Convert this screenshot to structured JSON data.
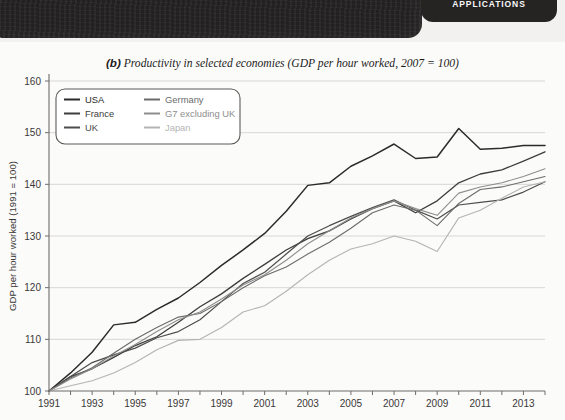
{
  "banner": {
    "tab_line_top": "AND APPLICATIONS",
    "tab_label": "APPLICATIONS"
  },
  "chart_title_prefix": "(b)",
  "chart_title_text": " Productivity in selected economies (GDP per hour worked, 2007 = 100)",
  "colors": {
    "usa": "#2b2b2b",
    "france": "#3d3d3d",
    "uk": "#4d4d4d",
    "germany": "#6b6b6b",
    "g7": "#8e8e8e",
    "japan": "#b4b4b4",
    "grid": "#d9d7d4",
    "axis": "#6e6c69",
    "card_bg": "#fbfbfa",
    "page_bg": "#f2f1ef",
    "banner_bg": "#222020"
  },
  "legend": {
    "items": [
      {
        "label": "USA",
        "color_key": "usa",
        "column": 0
      },
      {
        "label": "France",
        "color_key": "france",
        "column": 0
      },
      {
        "label": "UK",
        "color_key": "uk",
        "column": 0
      },
      {
        "label": "Germany",
        "color_key": "germany",
        "column": 1
      },
      {
        "label": "G7 excluding UK",
        "color_key": "g7",
        "column": 1
      },
      {
        "label": "Japan",
        "color_key": "japan",
        "column": 1
      }
    ]
  },
  "chart_data": {
    "type": "line",
    "title": "(b) Productivity in selected economies (GDP per hour worked, 2007 = 100)",
    "xlabel": "",
    "ylabel": "GDP per hour worked (1991 = 100)",
    "xlim": [
      1991,
      2014
    ],
    "ylim": [
      100,
      160
    ],
    "yticks": [
      100,
      110,
      120,
      130,
      140,
      150,
      160
    ],
    "xticks": [
      1991,
      1992,
      1993,
      1994,
      1995,
      1996,
      1997,
      1998,
      1999,
      2000,
      2001,
      2002,
      2003,
      2004,
      2005,
      2006,
      2007,
      2008,
      2009,
      2010,
      2011,
      2012,
      2013,
      2014
    ],
    "xtick_labels_shown": [
      1991,
      1993,
      1995,
      1997,
      1999,
      2001,
      2003,
      2005,
      2007,
      2009,
      2011,
      2013
    ],
    "grid": "horizontal",
    "legend_position": "top-left-inside",
    "x": [
      1991,
      1992,
      1993,
      1994,
      1995,
      1996,
      1997,
      1998,
      1999,
      2000,
      2001,
      2002,
      2003,
      2004,
      2005,
      2006,
      2007,
      2008,
      2009,
      2010,
      2011,
      2012,
      2013,
      2014
    ],
    "series": [
      {
        "name": "USA",
        "color_key": "usa",
        "values": [
          100.0,
          103.5,
          107.5,
          112.8,
          113.3,
          115.8,
          118.0,
          121.0,
          124.3,
          127.3,
          130.5,
          134.8,
          139.8,
          140.3,
          143.5,
          145.5,
          147.8,
          145.0,
          145.3,
          150.8,
          146.8,
          147.0,
          147.5,
          147.5
        ]
      },
      {
        "name": "France",
        "color_key": "france",
        "values": [
          100.0,
          102.8,
          104.3,
          106.5,
          108.8,
          110.5,
          113.3,
          116.3,
          118.8,
          121.8,
          124.5,
          127.3,
          129.5,
          131.0,
          133.3,
          135.3,
          136.8,
          134.5,
          136.8,
          140.3,
          142.0,
          142.8,
          144.5,
          146.3
        ]
      },
      {
        "name": "UK",
        "color_key": "uk",
        "values": [
          100.0,
          102.8,
          105.5,
          107.0,
          108.3,
          110.3,
          111.5,
          113.8,
          117.3,
          120.8,
          123.0,
          126.5,
          130.0,
          132.0,
          133.8,
          135.5,
          137.0,
          135.0,
          133.3,
          136.0,
          136.5,
          137.0,
          138.5,
          140.5
        ]
      },
      {
        "name": "Germany",
        "color_key": "germany",
        "values": [
          100.0,
          102.5,
          104.5,
          107.3,
          110.0,
          112.3,
          114.3,
          115.0,
          117.3,
          120.0,
          122.3,
          124.0,
          126.5,
          128.8,
          131.5,
          134.5,
          136.0,
          135.0,
          132.0,
          136.3,
          139.0,
          139.5,
          140.5,
          141.5
        ]
      },
      {
        "name": "G7 excluding UK",
        "color_key": "g7",
        "values": [
          100.0,
          102.3,
          104.3,
          106.8,
          109.0,
          111.5,
          113.8,
          115.3,
          117.8,
          120.5,
          122.5,
          125.3,
          128.5,
          131.0,
          133.5,
          135.3,
          136.8,
          135.3,
          134.0,
          138.3,
          139.5,
          140.3,
          141.5,
          143.0
        ]
      },
      {
        "name": "Japan",
        "color_key": "japan",
        "values": [
          100.0,
          101.0,
          102.0,
          103.5,
          105.5,
          108.0,
          109.8,
          110.0,
          112.3,
          115.3,
          116.5,
          119.3,
          122.5,
          125.3,
          127.5,
          128.5,
          130.0,
          129.0,
          127.0,
          133.5,
          135.0,
          137.3,
          139.5,
          140.5
        ]
      }
    ]
  }
}
